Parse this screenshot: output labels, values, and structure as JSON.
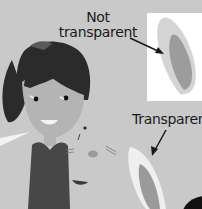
{
  "illustration": {
    "labels": {
      "not_transparent_line1": "Not",
      "not_transparent_line2": "transparent",
      "transparent": "Transparent"
    },
    "colors": {
      "background": "#c9c9c9",
      "panel": "#ffffff",
      "hair": "#2b2b2b",
      "shirt": "#474747",
      "skin": "#b4b4b4",
      "ear_outer_opaque": "#d6d6d6",
      "ear_inner": "#9a9a9a",
      "ear_outer_transparent": "#eeeeee",
      "arrow": "#1a1a1a"
    }
  }
}
